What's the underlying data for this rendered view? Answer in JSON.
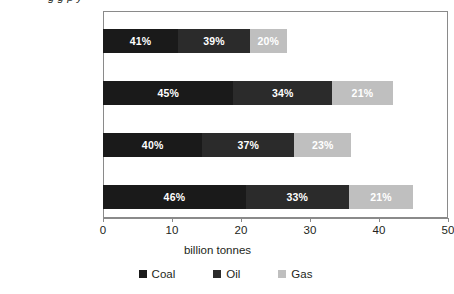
{
  "title_remnant": "g      g           p            y",
  "chart_data": {
    "type": "bar",
    "orientation": "horizontal",
    "stacked": true,
    "title": "",
    "xlabel": "billion tonnes",
    "ylabel": "",
    "xlim": [
      0,
      50
    ],
    "xticks": [
      0,
      10,
      20,
      30,
      40,
      50
    ],
    "xtick_labels": [
      "0",
      "10",
      "20",
      "30",
      "40",
      "50"
    ],
    "grid": false,
    "legend_position": "bottom",
    "categories": [
      "2005",
      "2030 Reference\nScenario",
      "2030 Alternative\nPolicy Scenario",
      "2030 High Growth\nScenario"
    ],
    "series": [
      {
        "name": "Coal",
        "color": "#1a1a1a",
        "values": [
          10.9,
          18.9,
          14.4,
          20.7
        ],
        "labels": [
          "41%",
          "45%",
          "40%",
          "46%"
        ]
      },
      {
        "name": "Oil",
        "color": "#2b2b2b",
        "values": [
          10.4,
          14.3,
          13.3,
          14.9
        ],
        "labels": [
          "39%",
          "34%",
          "37%",
          "33%"
        ]
      },
      {
        "name": "Gas",
        "color": "#bfbfbf",
        "values": [
          5.3,
          8.8,
          8.3,
          9.4
        ],
        "labels": [
          "20%",
          "21%",
          "23%",
          "21%"
        ]
      }
    ],
    "totals": [
      26.6,
      42.0,
      36.0,
      45.0
    ]
  },
  "legend": {
    "items": [
      {
        "label": "Coal",
        "color": "#1a1a1a"
      },
      {
        "label": "Oil",
        "color": "#2b2b2b"
      },
      {
        "label": "Gas",
        "color": "#bfbfbf"
      }
    ]
  }
}
